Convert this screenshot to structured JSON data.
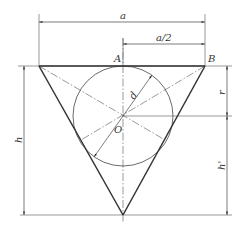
{
  "diagram": {
    "type": "geometry-construction",
    "colors": {
      "outline": "#333333",
      "thin": "#555555",
      "background": "#ffffff"
    },
    "labels": {
      "width_a": "a",
      "half_width": "a/2",
      "point_A": "A",
      "point_B": "B",
      "center_O": "O",
      "diameter_d": "d",
      "height_h": "h",
      "radius_r": "r",
      "height_h_prime": "h'"
    },
    "dimensions": [
      {
        "name": "a",
        "from": "left vertex",
        "to": "B"
      },
      {
        "name": "a/2",
        "from": "A",
        "to": "B"
      },
      {
        "name": "h",
        "from": "top edge",
        "to": "bottom vertex"
      },
      {
        "name": "r",
        "from": "top edge",
        "to": "center O"
      },
      {
        "name": "h'",
        "from": "center O",
        "to": "bottom vertex"
      }
    ]
  }
}
